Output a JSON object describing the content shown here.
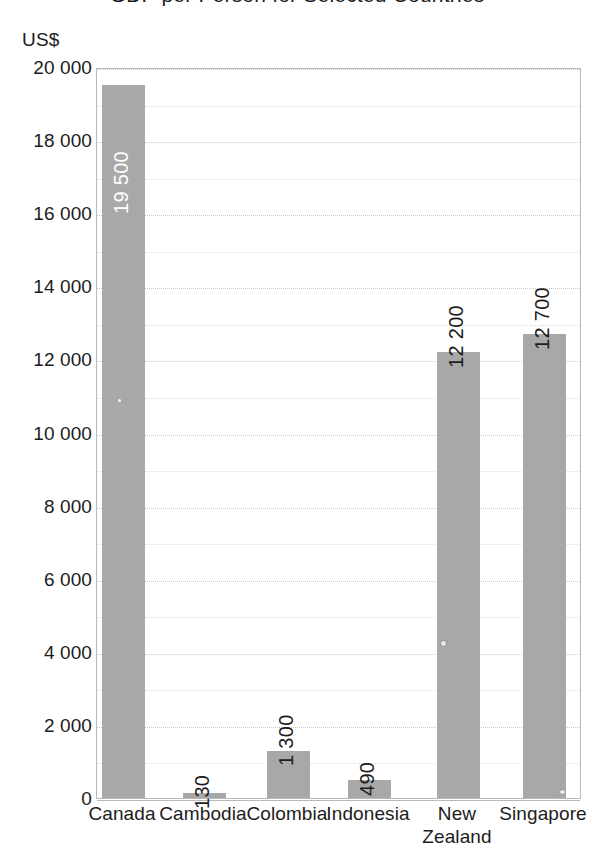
{
  "chart_data": {
    "type": "bar",
    "title": "GDP per Person for Selected Countries",
    "xlabel": "",
    "ylabel": "US$",
    "unit_label": "US$",
    "categories": [
      "Canada",
      "Cambodia",
      "Colombia",
      "Indonesia",
      "New Zealand",
      "Singapore"
    ],
    "values": [
      19500,
      130,
      1300,
      490,
      12200,
      12700
    ],
    "value_labels": [
      "19 500",
      "130",
      "1 300",
      "490",
      "12 200",
      "12 700"
    ],
    "label_placement": [
      "inside",
      "outside",
      "outside",
      "outside",
      "outside",
      "outside"
    ],
    "ylim": [
      0,
      20000
    ],
    "ytick_values": [
      0,
      2000,
      4000,
      6000,
      8000,
      10000,
      12000,
      14000,
      16000,
      18000,
      20000
    ],
    "ytick_labels": [
      "0",
      "2 000",
      "4 000",
      "6 000",
      "8 000",
      "10 000",
      "12 000",
      "14 000",
      "16 000",
      "18 000",
      "20 000"
    ],
    "minor_tick_step": 1000,
    "grid": true,
    "legend": "none",
    "bar_color": "#a8a8a8",
    "grid_color": "#dcdcdc",
    "axis_color": "#b9b9b9",
    "text_color": "#1c1c1c",
    "value_label_orientation": "vertical"
  },
  "x_axis_labels": [
    {
      "lines": [
        "Canada"
      ]
    },
    {
      "lines": [
        "Cambodia"
      ]
    },
    {
      "lines": [
        "Colombia"
      ]
    },
    {
      "lines": [
        "Indonesia"
      ]
    },
    {
      "lines": [
        "New",
        "Zealand"
      ]
    },
    {
      "lines": [
        "Singapore"
      ]
    }
  ]
}
